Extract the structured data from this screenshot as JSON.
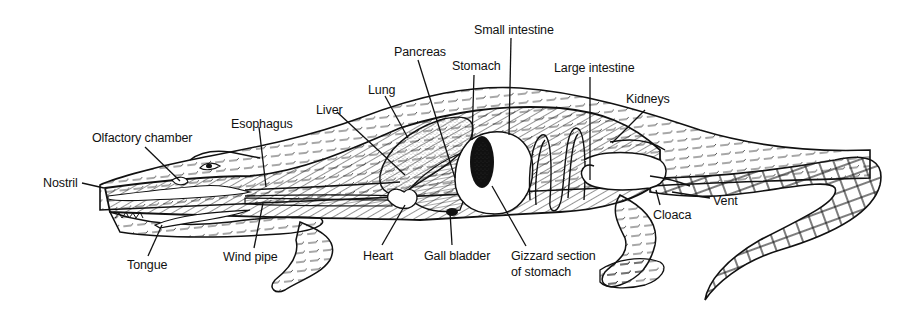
{
  "diagram": {
    "colors": {
      "ink": "#111111",
      "background": "#ffffff",
      "stipple": "#555555"
    },
    "labels": {
      "nostril": "Nostril",
      "olfactory_chamber": "Olfactory chamber",
      "esophagus": "Esophagus",
      "liver": "Liver",
      "lung": "Lung",
      "pancreas": "Pancreas",
      "stomach": "Stomach",
      "small_intestine": "Small intestine",
      "large_intestine": "Large intestine",
      "kidneys": "Kidneys",
      "vent": "Vent",
      "cloaca": "Cloaca",
      "tongue": "Tongue",
      "wind_pipe": "Wind pipe",
      "heart": "Heart",
      "gall_bladder": "Gall bladder",
      "gizzard_line1": "Gizzard section",
      "gizzard_line2": "of stomach"
    }
  }
}
